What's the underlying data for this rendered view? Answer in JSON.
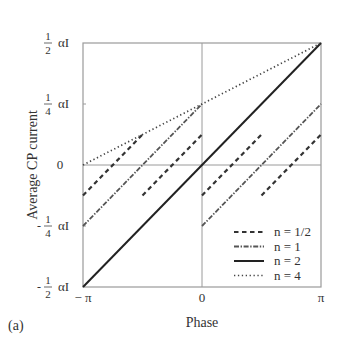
{
  "chart_data": {
    "type": "line",
    "title": "",
    "panel_label": "(a)",
    "xlabel": "Phase",
    "ylabel": "Average CP current",
    "xlim": [
      -3.14159,
      3.14159
    ],
    "ylim": [
      -0.5,
      0.5
    ],
    "y_unit": "αI",
    "x_ticks": [
      {
        "value": -3.14159,
        "label": "− π"
      },
      {
        "value": 0,
        "label": "0"
      },
      {
        "value": 3.14159,
        "label": "π"
      }
    ],
    "y_ticks": [
      {
        "value": 0.5,
        "num": "1",
        "den": "2",
        "sign": "",
        "unit": "αI"
      },
      {
        "value": 0.25,
        "num": "1",
        "den": "4",
        "sign": "",
        "unit": "αI"
      },
      {
        "value": 0,
        "plain": "0"
      },
      {
        "value": -0.25,
        "num": "1",
        "den": "4",
        "sign": "-",
        "unit": "αI"
      },
      {
        "value": -0.5,
        "num": "1",
        "den": "2",
        "sign": "-",
        "unit": "αI"
      }
    ],
    "grid": "axes through origin",
    "legend_position": "lower right (inside)",
    "series": [
      {
        "name": "n = 1/2",
        "style": "dashed",
        "segments": [
          {
            "x": [
              -3.14159,
              -1.5708
            ],
            "y": [
              -0.125,
              0.125
            ]
          },
          {
            "x": [
              -1.5708,
              0
            ],
            "y": [
              -0.125,
              0.125
            ]
          },
          {
            "x": [
              0,
              1.5708
            ],
            "y": [
              -0.125,
              0.125
            ]
          },
          {
            "x": [
              1.5708,
              3.14159
            ],
            "y": [
              -0.125,
              0.125
            ]
          }
        ]
      },
      {
        "name": "n = 1",
        "style": "dash-dot",
        "segments": [
          {
            "x": [
              -3.14159,
              0
            ],
            "y": [
              -0.25,
              0.25
            ]
          },
          {
            "x": [
              0,
              3.14159
            ],
            "y": [
              -0.25,
              0.25
            ]
          }
        ]
      },
      {
        "name": "n = 2",
        "style": "solid",
        "segments": [
          {
            "x": [
              -3.14159,
              3.14159
            ],
            "y": [
              -0.5,
              0.5
            ]
          }
        ]
      },
      {
        "name": "n = 4",
        "style": "dotted",
        "segments": [
          {
            "x": [
              -3.14159,
              3.14159
            ],
            "y": [
              0,
              0.5
            ]
          }
        ]
      }
    ]
  }
}
